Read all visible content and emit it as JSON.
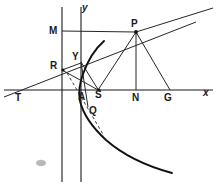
{
  "figure": {
    "name": "parabola-tangent-normal-construction",
    "width": 216,
    "height": 188,
    "background_color": "#ffffff",
    "ink_color": "#1a1a1a",
    "curve_color": "#111111",
    "smudge_color": "#b9b9b9"
  },
  "axes": {
    "x_axis": {
      "label": "x",
      "label_x": 203,
      "label_y": 93,
      "y_pixel": 90,
      "x_start": 4,
      "x_end": 213
    },
    "y_axis": {
      "label": "y",
      "label_x": 82,
      "label_y": 4,
      "x_pixel": 81,
      "y_start": 7,
      "y_end": 182
    },
    "directrix": {
      "name": "directrix",
      "x_pixel": 62,
      "y_start": 7,
      "y_end": 182
    }
  },
  "points": [
    {
      "id": "M",
      "label": "M",
      "x": 62,
      "y": 31,
      "label_x": 49,
      "label_y": 26,
      "dot": false,
      "role": "foot-of-perpendicular-on-directrix"
    },
    {
      "id": "P",
      "label": "P",
      "x": 136,
      "y": 32,
      "label_x": 131,
      "label_y": 19,
      "dot": true,
      "role": "point-on-parabola"
    },
    {
      "id": "Y",
      "label": "Y",
      "x": 81,
      "y": 64,
      "label_x": 73,
      "label_y": 52,
      "dot": true,
      "role": "foot-on-tangent-at-vertex"
    },
    {
      "id": "R",
      "label": "R",
      "x": 62,
      "y": 70,
      "label_x": 50,
      "label_y": 62,
      "dot": true,
      "role": "tangent-meets-directrix"
    },
    {
      "id": "T",
      "label": "T",
      "x": 22,
      "y": 90,
      "label_x": 15,
      "label_y": 93,
      "dot": false,
      "role": "tangent-meets-x-axis"
    },
    {
      "id": "A",
      "label": "A",
      "x": 80,
      "y": 90,
      "label_x": 78,
      "label_y": 92,
      "dot": false,
      "role": "vertex"
    },
    {
      "id": "S",
      "label": "S",
      "x": 98,
      "y": 90,
      "label_x": 96,
      "label_y": 91,
      "dot": true,
      "role": "focus"
    },
    {
      "id": "N",
      "label": "N",
      "x": 136,
      "y": 90,
      "label_x": 132,
      "label_y": 93,
      "dot": false,
      "role": "foot-of-ordinate"
    },
    {
      "id": "G",
      "label": "G",
      "x": 170,
      "y": 90,
      "label_x": 164,
      "label_y": 93,
      "dot": false,
      "role": "normal-meets-x-axis"
    },
    {
      "id": "Q",
      "label": "Q",
      "x": 92,
      "y": 112,
      "label_x": 90,
      "label_y": 107,
      "dot": false,
      "role": "second-point-on-parabola"
    }
  ],
  "segments": [
    {
      "name": "tangent-line-TPR",
      "from": "T",
      "to": "P",
      "x1": 4,
      "y1": 97,
      "x2": 196,
      "y2": 22,
      "style": "solid"
    },
    {
      "name": "tangent-extension-beyond-P",
      "x1": 136,
      "y1": 32,
      "x2": 213,
      "y2": 8,
      "style": "solid"
    },
    {
      "name": "perpendicular-MP",
      "from": "M",
      "to": "P",
      "x1": 62,
      "y1": 31,
      "x2": 136,
      "y2": 32,
      "style": "solid"
    },
    {
      "name": "focal-radius-SP",
      "from": "S",
      "to": "P",
      "x1": 98,
      "y1": 90,
      "x2": 136,
      "y2": 32,
      "style": "solid"
    },
    {
      "name": "ordinate-PN",
      "from": "P",
      "to": "N",
      "x1": 136,
      "y1": 32,
      "x2": 136,
      "y2": 90,
      "style": "solid"
    },
    {
      "name": "normal-PG",
      "from": "P",
      "to": "G",
      "x1": 136,
      "y1": 32,
      "x2": 170,
      "y2": 90,
      "style": "solid"
    },
    {
      "name": "segment-RS",
      "from": "R",
      "to": "S",
      "x1": 62,
      "y1": 70,
      "x2": 98,
      "y2": 90,
      "style": "solid"
    },
    {
      "name": "segment-YS",
      "from": "Y",
      "to": "S",
      "x1": 81,
      "y1": 64,
      "x2": 98,
      "y2": 90,
      "style": "solid"
    },
    {
      "name": "segment-RY-to-A",
      "from": "Y",
      "to": "A",
      "x1": 81,
      "y1": 64,
      "x2": 86,
      "y2": 104,
      "style": "solid"
    },
    {
      "name": "segment-R-to-Y",
      "from": "R",
      "to": "Y",
      "x1": 62,
      "y1": 70,
      "x2": 81,
      "y2": 64,
      "style": "solid"
    },
    {
      "name": "dashed-RAQ",
      "from": "R",
      "to": "Q",
      "x1": 67,
      "y1": 73,
      "x2": 103,
      "y2": 134,
      "style": "dashed"
    }
  ],
  "curve": {
    "name": "parabola",
    "description": "rightward-opening parabola, vertex at A, focus S",
    "path": "M 104 41 C 96 48 88 60 83 74 C 79 85 78 92 80 101 C 83 114 92 127 106 140 C 122 154 146 166 172 173"
  },
  "artifacts": [
    {
      "name": "gray-smudge",
      "x": 41,
      "y": 163,
      "rx": 5,
      "ry": 3.2
    }
  ]
}
